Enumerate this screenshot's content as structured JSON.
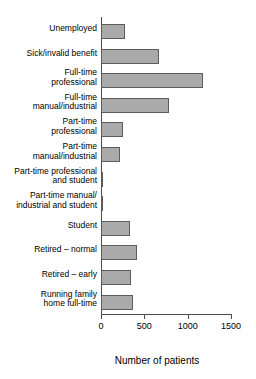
{
  "chart_data": {
    "type": "bar",
    "orientation": "horizontal",
    "title": "",
    "xlabel": "Number of patients",
    "ylabel": "",
    "xlim": [
      0,
      1500
    ],
    "xticks": [
      0,
      500,
      1000,
      1500
    ],
    "xtick_labels": [
      "0",
      "500",
      "1000",
      "1500"
    ],
    "grid": false,
    "legend": null,
    "bar_color": "#aaaaaa",
    "bar_edge_color": "#5c5c5c",
    "axis_color": "#4d4d4d",
    "categories": [
      "Unemployed",
      "Sick/invalid benefit",
      "Full-time\nprofessional",
      "Full-time\nmanual/industrial",
      "Part-time\nprofessional",
      "Part-time\nmanual/industrial",
      "Part-time professional\nand student",
      "Part-time manual/\nindustrial and student",
      "Student",
      "Retired – normal",
      "Retired – early",
      "Running family\nhome full-time"
    ],
    "values": [
      275,
      670,
      1180,
      785,
      255,
      220,
      25,
      15,
      335,
      415,
      345,
      370
    ]
  },
  "axis": {
    "x_title": "Number of patients"
  }
}
